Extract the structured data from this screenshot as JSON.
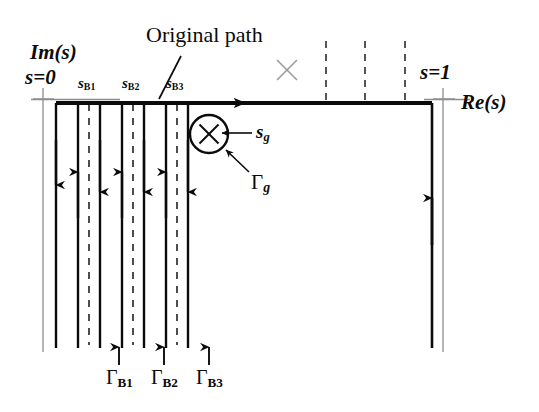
{
  "figure": {
    "title_annotation": "Original path",
    "axis_labels": {
      "imaginary": "Im(s)",
      "real": "Re(s)",
      "origin": "s=0",
      "unit_point": "s=1"
    },
    "branch_point_labels": [
      {
        "base": "s",
        "sub": "B1",
        "x": 78,
        "y": 76
      },
      {
        "base": "s",
        "sub": "B2",
        "x": 122,
        "y": 76
      },
      {
        "base": "s",
        "sub": "B3",
        "x": 165,
        "y": 76
      }
    ],
    "branch_cut_contour_labels": [
      {
        "base": "Γ",
        "sub": "B1",
        "x": 110,
        "y": 367
      },
      {
        "base": "Γ",
        "sub": "B2",
        "x": 155,
        "y": 367
      },
      {
        "base": "Γ",
        "sub": "B3",
        "x": 200,
        "y": 367
      }
    ],
    "pole_labels": {
      "pole_point": {
        "base": "s",
        "sub": "g"
      },
      "pole_contour": {
        "base": "Γ",
        "sub": "g"
      }
    },
    "colors": {
      "ink": "#0b0b0b",
      "thin_gray": "#8d8d8d",
      "pole_mark_gray": "#9a9a9a",
      "background": "#ffffff"
    },
    "geometry": {
      "axis_y": 103,
      "axis_x_start": 56,
      "axis_x_end": 432,
      "bottom_y": 348,
      "origin_tick_x": 43,
      "unit_tick_x": 443,
      "solid_down_lines_x": [
        56,
        100,
        144,
        188
      ],
      "solid_up_lines_x": [
        78,
        122,
        166
      ],
      "dashed_cut_lines_x": [
        89,
        133,
        177
      ],
      "dashed_top_lines_x": [
        326,
        365,
        405
      ],
      "right_return_line_x": 432,
      "right_thin_line_x": 443,
      "left_thin_line_x": 43
    },
    "pole_marker": {
      "circle_center_x": 209,
      "circle_center_y": 134,
      "circle_radius": 19,
      "cross_marker_x": 287,
      "cross_marker_y": 70
    }
  }
}
